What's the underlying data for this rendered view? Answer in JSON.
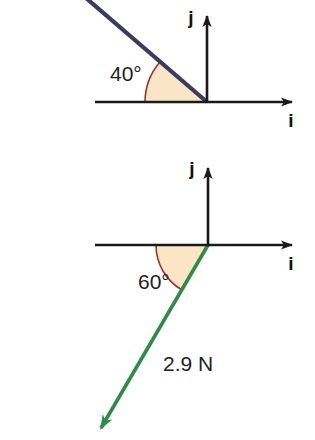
{
  "figure": {
    "title": "",
    "background_color": "#ffffff",
    "width": 315,
    "height": 440,
    "diagrams": [
      {
        "id": "upper-diagram",
        "name": "vector-diagram-40-degrees",
        "origin": {
          "x": 207,
          "y": 102
        },
        "axes": {
          "horizontal": {
            "label": "i",
            "label_position": {
              "x": 291,
              "y": 125
            },
            "start": {
              "x": 95,
              "y": 102
            },
            "end": {
              "x": 300,
              "y": 102
            },
            "color": "#1a1a1a",
            "arrow": "end"
          },
          "vertical": {
            "label": "j",
            "label_position": {
              "x": 193,
              "y": 22
            },
            "start": {
              "x": 207,
              "y": 102
            },
            "end": {
              "x": 207,
              "y": 6
            },
            "color": "#1a1a1a",
            "arrow": "end"
          }
        },
        "vector": {
          "name": "blue-vector",
          "color": "#3c3a63",
          "angle_degrees": 40,
          "direction": "up-left",
          "magnitude_label": "",
          "has_arrowhead": false,
          "clipped_at_edge": true,
          "start": {
            "x": 207,
            "y": 102
          },
          "end": {
            "x": 89,
            "y": 0
          }
        },
        "angle_arc": {
          "label": "40°",
          "value": 40,
          "unit": "degrees",
          "label_position": {
            "x": 131,
            "y": 74
          },
          "fill_color": "#fae6c6",
          "stroke_color": "#a03030",
          "radius": 62,
          "measured_from": "positive-x-axis",
          "direction": "counterclockwise-to-left"
        }
      },
      {
        "id": "lower-diagram",
        "name": "force-vector-diagram-60-degrees",
        "origin": {
          "x": 208,
          "y": 245
        },
        "axes": {
          "horizontal": {
            "label": "i",
            "label_position": {
              "x": 291,
              "y": 268
            },
            "start": {
              "x": 95,
              "y": 245
            },
            "end": {
              "x": 300,
              "y": 245
            },
            "color": "#1a1a1a",
            "arrow": "end"
          },
          "vertical": {
            "label": "j",
            "label_position": {
              "x": 194,
              "y": 173
            },
            "start": {
              "x": 208,
              "y": 245
            },
            "end": {
              "x": 208,
              "y": 158
            },
            "color": "#1a1a1a",
            "arrow": "end"
          }
        },
        "vector": {
          "name": "green-force-vector",
          "color": "#2f8b46",
          "angle_degrees": 60,
          "direction": "down-left",
          "magnitude_label": "2.9 N",
          "magnitude_value": 2.9,
          "magnitude_unit": "N",
          "magnitude_label_position": {
            "x": 163,
            "y": 370
          },
          "has_arrowhead": true,
          "start": {
            "x": 208,
            "y": 245
          },
          "end": {
            "x": 95,
            "y": 433
          }
        },
        "angle_arc": {
          "label": "60°",
          "value": 60,
          "unit": "degrees",
          "label_position": {
            "x": 138,
            "y": 288
          },
          "fill_color": "#fae6c6",
          "stroke_color": "#a03030",
          "radius": 52,
          "measured_from": "negative-x-axis",
          "direction": "clockwise-down"
        }
      }
    ]
  },
  "colors": {
    "axis": "#1a1a1a",
    "blue_vector": "#3c3a63",
    "green_vector": "#2f8b46",
    "arc_fill": "#fae6c6",
    "arc_stroke": "#a03030",
    "text": "#222222",
    "background": "#ffffff"
  }
}
